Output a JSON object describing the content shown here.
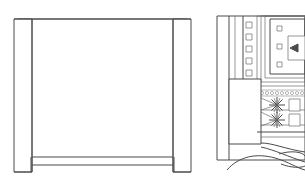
{
  "page": {
    "background_color": "#ffffff",
    "width": 305,
    "height": 193,
    "stroke_color": "#4a4a4a",
    "secondary_stroke_color": "#6b6b6b",
    "fine_stroke_color": "#7d7d7d"
  },
  "figures": [
    {
      "id": "figure-left",
      "name": "cabinet-elevation-drawing",
      "caption": "",
      "description": "Front elevation outline of a cabinet or sideboard with a wide body panel and two narrow vertical legs at the left and right ends",
      "parts": [
        {
          "name": "body-panel",
          "label": ""
        },
        {
          "name": "left-leg",
          "label": ""
        },
        {
          "name": "right-leg",
          "label": ""
        },
        {
          "name": "top-rail",
          "label": ""
        },
        {
          "name": "bottom-rail",
          "label": ""
        }
      ]
    },
    {
      "id": "figure-right",
      "name": "machine-assembly-drawing",
      "caption": "",
      "description": "Partial technical drawing of a machine assembly showing a nested rectangular frame, a column of small square fasteners, radial starburst details and curved contour lines at the base",
      "parts": [
        {
          "name": "outer-frame",
          "label": ""
        },
        {
          "name": "nested-frame",
          "label": ""
        },
        {
          "name": "fastener-square",
          "label": ""
        },
        {
          "name": "starburst-detail",
          "label": ""
        },
        {
          "name": "base-block",
          "label": ""
        },
        {
          "name": "contour-curve",
          "label": ""
        }
      ]
    }
  ]
}
